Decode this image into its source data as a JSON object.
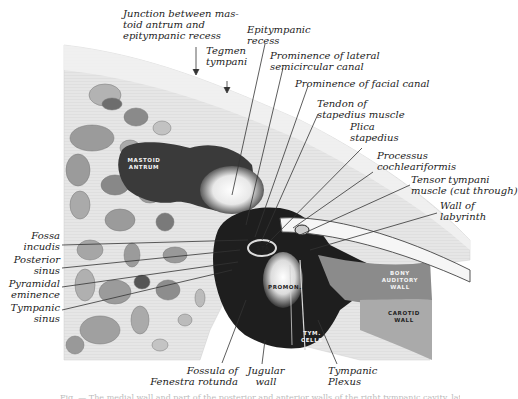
{
  "figure": {
    "type": "anatomical-illustration",
    "colors": {
      "background": "#ffffff",
      "bone_light": "#e8e8e8",
      "bone_mid": "#b9b9b9",
      "cavity_dark": "#1c1c1c",
      "leader_line": "#333333",
      "label_text": "#222222"
    }
  },
  "labels": {
    "top": [
      {
        "id": "junction",
        "text": "Junction between mas-\ntoid antrum and\nepitympanic recess"
      },
      {
        "id": "tegmen",
        "text": "Tegmen\ntympani"
      },
      {
        "id": "epitympanic",
        "text": "Epitympanic\nrecess"
      },
      {
        "id": "lateral_canal",
        "text": "Prominence of lateral\nsemicircular canal"
      },
      {
        "id": "facial_canal",
        "text": "Prominence of facial canal"
      },
      {
        "id": "tendon",
        "text": "Tendon of\nstapedius muscle"
      },
      {
        "id": "plica",
        "text": "Plica\nstapedius"
      },
      {
        "id": "processus",
        "text": "Processus\ncochleariformis"
      },
      {
        "id": "tensor",
        "text": "Tensor tympani\nmuscle (cut through)"
      },
      {
        "id": "labyrinth",
        "text": "Wall of\nlabyrinth"
      }
    ],
    "left": [
      {
        "id": "fossa_incudis",
        "text": "Fossa\nincudis"
      },
      {
        "id": "posterior_sinus",
        "text": "Posterior\nsinus"
      },
      {
        "id": "pyramidal",
        "text": "Pyramidal\neminence"
      },
      {
        "id": "tympanic_sinus",
        "text": "Tympanic\nsinus"
      }
    ],
    "bottom": [
      {
        "id": "fossula",
        "text": "Fossula of\nFenestra rotunda"
      },
      {
        "id": "jugular",
        "text": "Jugular\nwall"
      },
      {
        "id": "plexus",
        "text": "Tympanic\nPlexus"
      }
    ],
    "inset_caps": [
      {
        "id": "mastoid_antrum",
        "text": "MASTOID\nANTRUM"
      },
      {
        "id": "stapes",
        "text": "STA"
      },
      {
        "id": "promon",
        "text": "PROMON."
      },
      {
        "id": "tym_cells",
        "text": "TYM.\nCELLS"
      },
      {
        "id": "bony_auditory",
        "text": "BONY\nAUDITORY\nWALL"
      },
      {
        "id": "carotid",
        "text": "CAROTID\nWALL"
      }
    ]
  },
  "caption": "Fig. — The medial wall and part of the posterior and anterior walls of the right tympanic cavity, lateral view."
}
